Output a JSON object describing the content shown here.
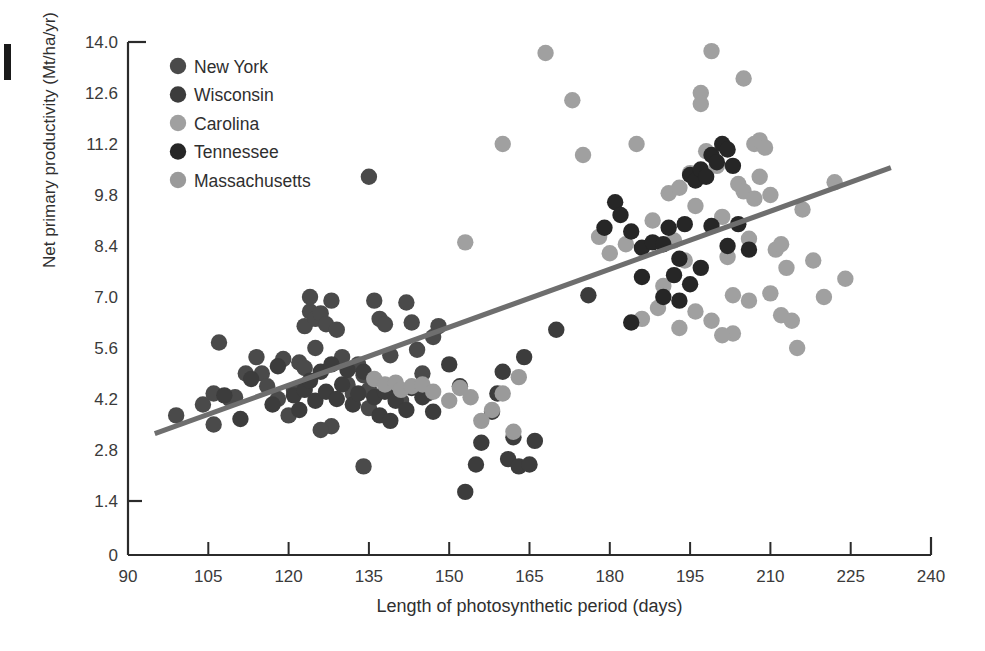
{
  "chart_data": {
    "type": "scatter",
    "title": "",
    "xlabel": "Length of photosynthetic period (days)",
    "ylabel": "Net primary productivity (Mt/ha/yr)",
    "xlim": [
      90,
      240
    ],
    "ylim": [
      0,
      14.0
    ],
    "xticks": [
      90,
      105,
      120,
      135,
      150,
      165,
      180,
      195,
      210,
      225,
      240
    ],
    "xtick_labels": [
      "90",
      "105",
      "120",
      "135",
      "150",
      "165",
      "180",
      "195",
      "210",
      "225",
      "240"
    ],
    "yticks": [
      0,
      1.4,
      2.8,
      4.2,
      5.6,
      7.0,
      8.4,
      9.8,
      11.2,
      12.6,
      14.0
    ],
    "ytick_labels": [
      "0",
      "1.4",
      "2.8",
      "4.2",
      "5.6",
      "7.0",
      "8.4",
      "9.8",
      "11.2",
      "12.6",
      "14.0"
    ],
    "grid": false,
    "legend_position": "upper-left-inside",
    "axis_break_below": 1.4,
    "trendline": {
      "label": "linear regression",
      "color": "#6e6e6e",
      "width": 5,
      "x_start": 95.0,
      "y_start": 3.25,
      "x_end": 232.5,
      "y_end": 10.55
    },
    "series": [
      {
        "name": "New York",
        "color": "#4a4a4a",
        "points": [
          [
            99,
            3.75
          ],
          [
            104,
            4.05
          ],
          [
            106,
            4.35
          ],
          [
            106,
            3.5
          ],
          [
            107,
            5.75
          ],
          [
            109,
            4.2
          ],
          [
            110,
            4.25
          ],
          [
            112,
            4.9
          ],
          [
            114,
            5.35
          ],
          [
            115,
            4.9
          ],
          [
            116,
            4.55
          ],
          [
            118,
            4.2
          ],
          [
            119,
            5.3
          ],
          [
            120,
            3.75
          ],
          [
            121,
            4.45
          ],
          [
            122,
            5.2
          ],
          [
            123,
            5.05
          ],
          [
            123,
            6.2
          ],
          [
            124,
            6.6
          ],
          [
            124,
            7.0
          ],
          [
            125,
            6.4
          ],
          [
            125,
            5.6
          ],
          [
            126,
            6.55
          ],
          [
            127,
            6.25
          ],
          [
            128,
            6.9
          ],
          [
            129,
            6.1
          ],
          [
            130,
            5.35
          ],
          [
            131,
            4.6
          ],
          [
            132,
            4.35
          ],
          [
            133,
            5.15
          ],
          [
            134,
            4.85
          ],
          [
            135,
            4.45
          ],
          [
            135,
            3.95
          ],
          [
            136,
            6.9
          ],
          [
            137,
            6.4
          ],
          [
            138,
            6.25
          ],
          [
            139,
            5.4
          ],
          [
            140,
            4.55
          ],
          [
            141,
            4.15
          ],
          [
            142,
            6.85
          ],
          [
            143,
            6.3
          ],
          [
            144,
            5.55
          ],
          [
            145,
            4.9
          ],
          [
            146,
            4.35
          ],
          [
            147,
            5.9
          ],
          [
            148,
            6.2
          ],
          [
            135,
            10.3
          ],
          [
            134,
            2.35
          ],
          [
            128,
            3.45
          ],
          [
            126,
            3.35
          ]
        ]
      },
      {
        "name": "Wisconsin",
        "color": "#3c3c3c",
        "points": [
          [
            121,
            4.3
          ],
          [
            122,
            3.9
          ],
          [
            123,
            4.45
          ],
          [
            124,
            4.7
          ],
          [
            125,
            4.15
          ],
          [
            126,
            4.95
          ],
          [
            127,
            4.4
          ],
          [
            128,
            5.15
          ],
          [
            129,
            4.2
          ],
          [
            130,
            4.6
          ],
          [
            131,
            5.0
          ],
          [
            132,
            4.05
          ],
          [
            133,
            4.35
          ],
          [
            134,
            4.95
          ],
          [
            136,
            4.25
          ],
          [
            137,
            3.75
          ],
          [
            138,
            4.4
          ],
          [
            139,
            3.6
          ],
          [
            140,
            4.15
          ],
          [
            142,
            3.9
          ],
          [
            143,
            4.5
          ],
          [
            145,
            4.25
          ],
          [
            147,
            3.85
          ],
          [
            150,
            5.15
          ],
          [
            152,
            4.55
          ],
          [
            153,
            1.65
          ],
          [
            155,
            2.4
          ],
          [
            156,
            3.0
          ],
          [
            158,
            3.85
          ],
          [
            159,
            4.35
          ],
          [
            160,
            4.95
          ],
          [
            161,
            2.55
          ],
          [
            162,
            3.15
          ],
          [
            163,
            2.35
          ],
          [
            164,
            5.35
          ],
          [
            165,
            2.4
          ],
          [
            166,
            3.05
          ],
          [
            170,
            6.1
          ],
          [
            176,
            7.05
          ],
          [
            113,
            4.75
          ],
          [
            117,
            4.05
          ],
          [
            118,
            5.1
          ],
          [
            108,
            4.3
          ],
          [
            111,
            3.65
          ]
        ]
      },
      {
        "name": "Carolina",
        "color": "#a0a0a0",
        "points": [
          [
            153,
            8.5
          ],
          [
            160,
            11.2
          ],
          [
            168,
            13.7
          ],
          [
            173,
            12.4
          ],
          [
            175,
            10.9
          ],
          [
            178,
            8.65
          ],
          [
            180,
            8.2
          ],
          [
            183,
            8.45
          ],
          [
            185,
            11.2
          ],
          [
            188,
            9.1
          ],
          [
            190,
            7.3
          ],
          [
            191,
            9.85
          ],
          [
            192,
            8.55
          ],
          [
            193,
            10.0
          ],
          [
            194,
            8.0
          ],
          [
            195,
            10.4
          ],
          [
            196,
            9.5
          ],
          [
            197,
            12.6
          ],
          [
            197,
            12.3
          ],
          [
            198,
            11.0
          ],
          [
            199,
            13.75
          ],
          [
            200,
            10.6
          ],
          [
            201,
            9.2
          ],
          [
            202,
            8.1
          ],
          [
            203,
            7.05
          ],
          [
            203,
            6.0
          ],
          [
            204,
            10.1
          ],
          [
            205,
            13.0
          ],
          [
            205,
            9.9
          ],
          [
            206,
            8.6
          ],
          [
            206,
            6.9
          ],
          [
            207,
            11.2
          ],
          [
            208,
            11.3
          ],
          [
            209,
            11.1
          ],
          [
            210,
            9.8
          ],
          [
            210,
            7.1
          ],
          [
            211,
            8.3
          ],
          [
            212,
            8.45
          ],
          [
            212,
            6.5
          ],
          [
            213,
            7.8
          ],
          [
            214,
            6.35
          ],
          [
            215,
            5.6
          ],
          [
            216,
            9.4
          ],
          [
            218,
            8.0
          ],
          [
            220,
            7.0
          ],
          [
            222,
            10.15
          ],
          [
            224,
            7.5
          ],
          [
            186,
            6.4
          ],
          [
            189,
            6.7
          ],
          [
            193,
            6.15
          ],
          [
            196,
            6.6
          ],
          [
            199,
            6.35
          ],
          [
            201,
            5.95
          ],
          [
            207,
            9.7
          ],
          [
            208,
            10.3
          ]
        ]
      },
      {
        "name": "Tennessee",
        "color": "#262626",
        "points": [
          [
            181,
            9.6
          ],
          [
            182,
            9.25
          ],
          [
            184,
            8.8
          ],
          [
            186,
            8.35
          ],
          [
            188,
            8.5
          ],
          [
            190,
            8.45
          ],
          [
            191,
            8.9
          ],
          [
            192,
            7.6
          ],
          [
            193,
            8.05
          ],
          [
            194,
            9.0
          ],
          [
            195,
            10.35
          ],
          [
            196,
            10.2
          ],
          [
            197,
            10.5
          ],
          [
            198,
            10.3
          ],
          [
            199,
            10.9
          ],
          [
            200,
            10.7
          ],
          [
            201,
            11.2
          ],
          [
            202,
            11.05
          ],
          [
            203,
            10.6
          ],
          [
            199,
            8.95
          ],
          [
            197,
            7.8
          ],
          [
            195,
            7.35
          ],
          [
            193,
            6.9
          ],
          [
            190,
            7.0
          ],
          [
            186,
            7.55
          ],
          [
            184,
            6.3
          ],
          [
            202,
            8.4
          ],
          [
            204,
            9.0
          ],
          [
            206,
            8.3
          ],
          [
            179,
            8.9
          ]
        ]
      },
      {
        "name": "Massachusetts",
        "color": "#9a9a9a",
        "points": [
          [
            136,
            4.75
          ],
          [
            138,
            4.6
          ],
          [
            140,
            4.65
          ],
          [
            141,
            4.45
          ],
          [
            143,
            4.55
          ],
          [
            145,
            4.6
          ],
          [
            147,
            4.4
          ],
          [
            150,
            4.15
          ],
          [
            152,
            4.5
          ],
          [
            156,
            3.6
          ],
          [
            158,
            3.9
          ],
          [
            160,
            4.35
          ],
          [
            162,
            3.3
          ],
          [
            163,
            4.8
          ],
          [
            154,
            4.25
          ]
        ]
      }
    ]
  },
  "legend": {
    "items": [
      {
        "label": "New York",
        "color": "#4a4a4a"
      },
      {
        "label": "Wisconsin",
        "color": "#3c3c3c"
      },
      {
        "label": "Carolina",
        "color": "#a0a0a0"
      },
      {
        "label": "Tennessee",
        "color": "#262626"
      },
      {
        "label": "Massachusetts",
        "color": "#9a9a9a"
      }
    ]
  },
  "axes": {
    "x_title": "Length of photosynthetic period (days)",
    "y_title": "Net primary productivity (Mt/ha/yr)"
  }
}
